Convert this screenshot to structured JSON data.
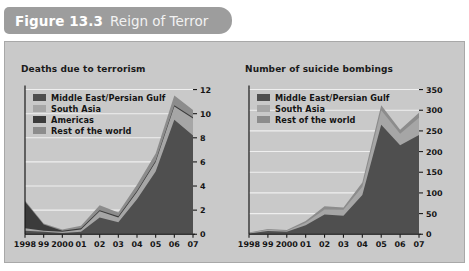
{
  "header": {
    "figure_number": "Figure 13.3",
    "figure_title": "Reign of Terror"
  },
  "colors": {
    "header_bar": "#9d9d9d",
    "panel_background": "#c9c9c9",
    "panel_border": "#a8a8a8",
    "gridline": "#efefef",
    "axis": "#1a1a1a",
    "middle_east": "#4f4f4f",
    "south_asia": "#a6a6a6",
    "americas": "#3b3b3b",
    "rest_of_world": "#8c8c8c"
  },
  "chart_data": [
    {
      "id": "deaths-due-to-terrorism",
      "type": "area",
      "stacked": true,
      "title": "Deaths due to terrorism",
      "xlabel": "",
      "ylabel": "",
      "x": [
        "1998",
        "99",
        "2000",
        "01",
        "02",
        "03",
        "04",
        "05",
        "06",
        "07"
      ],
      "xtick_labels": [
        "1998",
        "99",
        "2000",
        "01",
        "02",
        "03",
        "04",
        "05",
        "06",
        "07"
      ],
      "ytick_labels": [
        "0",
        "2",
        "4",
        "6",
        "8",
        "10",
        "12"
      ],
      "ylim": [
        0,
        12
      ],
      "ytick_values": [
        0,
        2,
        4,
        6,
        8,
        10,
        12
      ],
      "grid": true,
      "legend_position": "upper-left",
      "series": [
        {
          "name": "Middle East/Persian Gulf",
          "color": "#4f4f4f",
          "values": [
            0.3,
            0.2,
            0.1,
            0.2,
            1.4,
            1.0,
            2.9,
            5.2,
            9.5,
            8.2
          ]
        },
        {
          "name": "South Asia",
          "color": "#a6a6a6",
          "values": [
            0.2,
            0.1,
            0.1,
            0.2,
            0.5,
            0.4,
            0.6,
            0.8,
            1.1,
            1.4
          ]
        },
        {
          "name": "Americas",
          "color": "#3b3b3b",
          "values": [
            2.2,
            0.5,
            0.1,
            0.1,
            0.1,
            0.1,
            0.1,
            0.1,
            0.1,
            0.1
          ]
        },
        {
          "name": "Rest of the world",
          "color": "#8c8c8c",
          "values": [
            0.1,
            0.1,
            0.1,
            0.2,
            0.4,
            0.3,
            0.5,
            0.6,
            0.8,
            0.6
          ]
        }
      ]
    },
    {
      "id": "number-of-suicide-bombings",
      "type": "area",
      "stacked": true,
      "title": "Number of suicide bombings",
      "xlabel": "",
      "ylabel": "",
      "x": [
        "1998",
        "99",
        "2000",
        "01",
        "02",
        "03",
        "04",
        "05",
        "06",
        "07"
      ],
      "xtick_labels": [
        "1998",
        "99",
        "2000",
        "01",
        "02",
        "03",
        "04",
        "05",
        "06",
        "07"
      ],
      "ytick_labels": [
        "0",
        "50",
        "100",
        "150",
        "200",
        "250",
        "300",
        "350"
      ],
      "ylim": [
        0,
        350
      ],
      "ytick_values": [
        0,
        50,
        100,
        150,
        200,
        250,
        300,
        350
      ],
      "grid": true,
      "legend_position": "upper-left",
      "series": [
        {
          "name": "Middle East/Persian Gulf",
          "color": "#4f4f4f",
          "values": [
            2,
            8,
            6,
            22,
            48,
            45,
            95,
            265,
            215,
            240
          ]
        },
        {
          "name": "South Asia",
          "color": "#a6a6a6",
          "values": [
            1,
            3,
            2,
            6,
            12,
            14,
            20,
            35,
            28,
            42
          ]
        },
        {
          "name": "Rest of the world",
          "color": "#8c8c8c",
          "values": [
            1,
            2,
            2,
            4,
            8,
            6,
            10,
            12,
            10,
            12
          ]
        }
      ]
    }
  ]
}
